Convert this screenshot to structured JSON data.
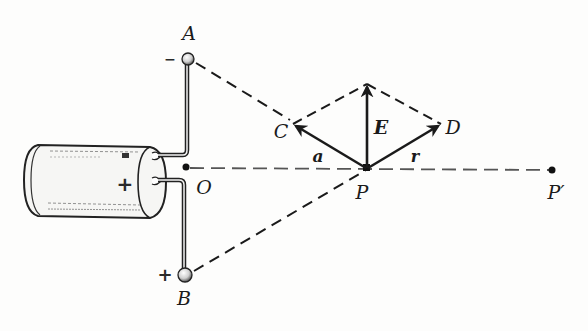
{
  "figure": {
    "points": {
      "A": "A",
      "B": "B",
      "O": "O",
      "P": "P",
      "P_prime": "P′",
      "C": "C",
      "D": "D"
    },
    "vectors": {
      "E": "E",
      "a": "a",
      "r": "r"
    },
    "charges": {
      "A_sign": "−",
      "B_sign": "+",
      "battery_sign": "+"
    },
    "colors": {
      "ink": "#1a1a1a",
      "paper": "#fdfdfc",
      "dotted": "#555555"
    }
  }
}
